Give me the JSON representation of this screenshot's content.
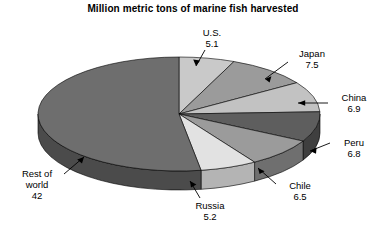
{
  "chart_data": {
    "type": "pie",
    "title": "Million metric tons of marine fish harvested",
    "unit": "million metric tons",
    "total": 80.0,
    "categories": [
      "U.S.",
      "Japan",
      "China",
      "Peru",
      "Chile",
      "Russia",
      "Rest of world"
    ],
    "values": [
      5.1,
      7.5,
      6.9,
      6.8,
      6.5,
      5.2,
      42
    ],
    "slices": [
      {
        "label": "U.S.",
        "value": 5.1,
        "color": "#c9c9c9",
        "side_color": "#9a9a9a"
      },
      {
        "label": "Japan",
        "value": 7.5,
        "color": "#9b9b9b",
        "side_color": "#6f6f6f"
      },
      {
        "label": "China",
        "value": 6.9,
        "color": "#c2c2c2",
        "side_color": "#8f8f8f"
      },
      {
        "label": "Peru",
        "value": 6.8,
        "color": "#5e5e5e",
        "side_color": "#3f3f3f"
      },
      {
        "label": "Chile",
        "value": 6.5,
        "color": "#9b9b9b",
        "side_color": "#6f6f6f"
      },
      {
        "label": "Russia",
        "value": 5.2,
        "color": "#e2e2e2",
        "side_color": "#b4b4b4"
      },
      {
        "label": "Rest of world",
        "value": 42,
        "color": "#6e6e6e",
        "side_color": "#4b4b4b"
      }
    ],
    "start_angle_deg": 0,
    "direction": "clockwise",
    "three_d": true,
    "legend": "callout-labels",
    "grid": false,
    "xlabel": "",
    "ylabel": ""
  },
  "labels": {
    "us": {
      "name": "U.S.",
      "value": "5.1"
    },
    "japan": {
      "name": "Japan",
      "value": "7.5"
    },
    "china": {
      "name": "China",
      "value": "6.9"
    },
    "peru": {
      "name": "Peru",
      "value": "6.8"
    },
    "chile": {
      "name": "Chile",
      "value": "6.5"
    },
    "russia": {
      "name": "Russia",
      "value": "5.2"
    },
    "rest": {
      "name": "Rest of",
      "name2": "world",
      "value": "42"
    }
  }
}
